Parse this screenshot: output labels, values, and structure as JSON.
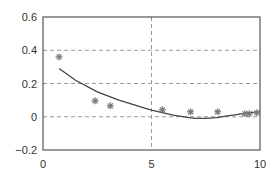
{
  "chart_data": {
    "type": "scatter",
    "title": "",
    "xlabel": "",
    "ylabel": "",
    "xlim": [
      0,
      10
    ],
    "ylim": [
      -0.2,
      0.6
    ],
    "grid": true,
    "grid_style": "dashed",
    "legend": null,
    "x_ticks": [
      0,
      5,
      10
    ],
    "x_tick_labels": [
      "0",
      "5",
      "10"
    ],
    "y_ticks": [
      -0.2,
      0,
      0.2,
      0.4,
      0.6
    ],
    "y_tick_labels": [
      "-0.2",
      "0",
      "0.2",
      "0.4",
      "0.6"
    ],
    "series": [
      {
        "name": "data",
        "kind": "scatter",
        "marker": "asterisk",
        "color": "#777777",
        "x": [
          0.74,
          2.4,
          3.1,
          5.5,
          6.8,
          8.05,
          9.3,
          9.5,
          9.85
        ],
        "y": [
          0.36,
          0.096,
          0.066,
          0.042,
          0.03,
          0.03,
          0.018,
          0.018,
          0.024
        ]
      },
      {
        "name": "fit",
        "kind": "line",
        "color": "#444444",
        "x": [
          0.74,
          1.5,
          2.5,
          3.5,
          4.5,
          5.0,
          5.5,
          6.0,
          6.5,
          7.0,
          7.5,
          8.0,
          8.5,
          9.0,
          9.5,
          10.0
        ],
        "y": [
          0.29,
          0.22,
          0.15,
          0.1,
          0.06,
          0.04,
          0.025,
          0.01,
          0.0,
          -0.01,
          -0.01,
          -0.005,
          0.005,
          0.015,
          0.025,
          0.03
        ]
      }
    ]
  }
}
